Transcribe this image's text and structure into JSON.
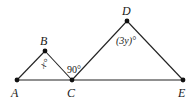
{
  "diagram": {
    "type": "geometry",
    "points": [
      {
        "id": "A",
        "label": "A",
        "x": 17,
        "y": 80
      },
      {
        "id": "B",
        "label": "B",
        "x": 45,
        "y": 51
      },
      {
        "id": "C",
        "label": "C",
        "x": 72,
        "y": 80
      },
      {
        "id": "D",
        "label": "D",
        "x": 127,
        "y": 21
      },
      {
        "id": "E",
        "label": "E",
        "x": 183,
        "y": 80
      }
    ],
    "segments": [
      [
        "A",
        "E"
      ],
      [
        "A",
        "B"
      ],
      [
        "B",
        "C"
      ],
      [
        "C",
        "D"
      ],
      [
        "D",
        "E"
      ]
    ],
    "angles": [
      {
        "at": "B",
        "label": "x°",
        "text": "x",
        "degree": "°"
      },
      {
        "at": "C",
        "label": "90°",
        "text": "90",
        "degree": "°"
      },
      {
        "at": "D",
        "label": "(3y)°",
        "text": "(3y)",
        "degree": "°"
      }
    ],
    "labels": {
      "A": "A",
      "B": "B",
      "C": "C",
      "D": "D",
      "E": "E",
      "angle_B": "x°",
      "angle_C": "90°",
      "angle_D": "(3y)°"
    }
  }
}
